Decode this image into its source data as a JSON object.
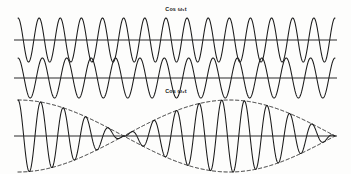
{
  "figure": {
    "background_color": "#fdfdfc",
    "ink_color": "#1a1a1a",
    "width": 351,
    "height": 174
  },
  "labels": {
    "wave1": "Cos ω₁t",
    "wave2": "Cos ω₂t"
  },
  "chart_data": {
    "type": "line",
    "xlabel": "",
    "ylabel": "",
    "grid": false,
    "legend_position": "none",
    "axis_x_start": 18,
    "axis_x_end": 335,
    "x_range": [
      0,
      1
    ],
    "panels": [
      {
        "name": "wave1",
        "label": "Cos ω₁t",
        "label_position": "above-center",
        "baseline_y": 40,
        "amplitude": 22,
        "cycles": 15.0,
        "phase": 0.0,
        "style": "solid",
        "envelope": false
      },
      {
        "name": "wave2",
        "label": "Cos ω₂t",
        "label_position": "below-center",
        "baseline_y": 78,
        "amplitude": 20,
        "cycles": 13.0,
        "phase": 0.0,
        "style": "solid",
        "envelope": false
      },
      {
        "name": "sum",
        "label": "",
        "label_position": "none",
        "baseline_y": 136,
        "amplitude": 36,
        "cycles": 14.0,
        "beat_cycles": 1.5,
        "phase": 0.0,
        "style": "solid",
        "envelope": true,
        "envelope_style": "dashed",
        "envelope_lobes": 3,
        "node_count": 2,
        "node_x_positions": [
          85,
          208
        ]
      }
    ],
    "series": [
      {
        "name": "Cos ω₁t",
        "cycles": 15.0,
        "amplitude": 22,
        "baseline_y": 40
      },
      {
        "name": "Cos ω₂t",
        "cycles": 13.0,
        "amplitude": 20,
        "baseline_y": 78
      },
      {
        "name": "Cos ω₁t + Cos ω₂t",
        "cycles": 14.0,
        "beat_cycles": 1.5,
        "amplitude": 36,
        "baseline_y": 136
      }
    ]
  }
}
